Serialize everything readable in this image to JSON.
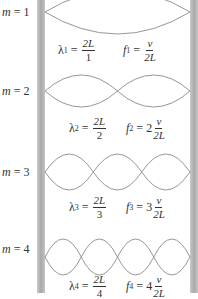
{
  "diagram": {
    "colors": {
      "wave": "#888888",
      "wall": "#b5b5b5",
      "text": "#333333"
    },
    "modes": [
      {
        "m_label": "m = 1",
        "m": "1",
        "lambda_sym": "λ",
        "lambda_sub": "1",
        "lambda_num": "2L",
        "lambda_den": "1",
        "f_sym": "f",
        "f_sub": "1",
        "f_coef": "",
        "f_num": "v",
        "f_den": "2L",
        "loops": 1
      },
      {
        "m_label": "m = 2",
        "m": "2",
        "lambda_sym": "λ",
        "lambda_sub": "2",
        "lambda_num": "2L",
        "lambda_den": "2",
        "f_sym": "f",
        "f_sub": "2",
        "f_coef": "2",
        "f_num": "v",
        "f_den": "2L",
        "loops": 2
      },
      {
        "m_label": "m = 3",
        "m": "3",
        "lambda_sym": "λ",
        "lambda_sub": "3",
        "lambda_num": "2L",
        "lambda_den": "3",
        "f_sym": "f",
        "f_sub": "3",
        "f_coef": "3",
        "f_num": "v",
        "f_den": "2L",
        "loops": 3
      },
      {
        "m_label": "m = 4",
        "m": "4",
        "lambda_sym": "λ",
        "lambda_sub": "4",
        "lambda_num": "2L",
        "lambda_den": "4",
        "f_sym": "f",
        "f_sub": "4",
        "f_coef": "4",
        "f_num": "v",
        "f_den": "2L",
        "loops": 4
      }
    ],
    "equals": "="
  }
}
